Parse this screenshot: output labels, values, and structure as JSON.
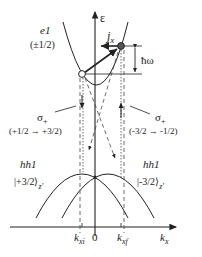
{
  "diagram": {
    "type": "band-structure-optical-transition",
    "axes": {
      "vertical_label": "ε",
      "horizontal_label_base": "k",
      "horizontal_label_sub": "x",
      "origin_label": "0"
    },
    "bands": {
      "e1": {
        "name": "e1",
        "spin": "(±1/2)"
      },
      "hh1_left": {
        "name": "hh1",
        "state": "|+3/2⟩",
        "sub": "z'"
      },
      "hh1_right": {
        "name": "hh1",
        "state": "|-3/2⟩",
        "sub": "z'"
      }
    },
    "current": {
      "base": "j",
      "sub": "x"
    },
    "energy": {
      "label": "ħω"
    },
    "transitions": {
      "left": {
        "polarization": "σ",
        "pol_sub": "+",
        "text_from": "(+1/2",
        "text_to": "+3/2)"
      },
      "right": {
        "polarization": "σ",
        "pol_sub": "+",
        "text_from": "(-3/2",
        "text_to": "-1/2)"
      }
    },
    "k_ticks": {
      "ki": {
        "base": "k",
        "sub": "xi"
      },
      "kf": {
        "base": "k",
        "sub": "xf"
      }
    },
    "colors": {
      "line": "#222222",
      "dashed": "#444444"
    }
  }
}
